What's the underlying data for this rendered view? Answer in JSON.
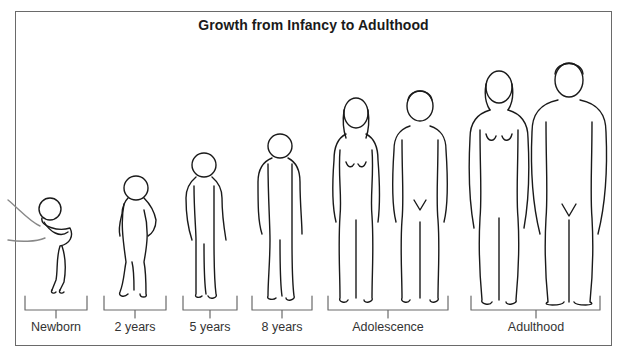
{
  "title": "Growth from Infancy to Adulthood",
  "stages": [
    {
      "label": "Newborn",
      "bracket": [
        25,
        87
      ],
      "figures": 1
    },
    {
      "label": "2 years",
      "bracket": [
        104,
        166
      ],
      "figures": 1
    },
    {
      "label": "5 years",
      "bracket": [
        183,
        237
      ],
      "figures": 1
    },
    {
      "label": "8 years",
      "bracket": [
        252,
        312
      ],
      "figures": 1
    },
    {
      "label": "Adolescence",
      "bracket": [
        328,
        448
      ],
      "figures": 2
    },
    {
      "label": "Adulthood",
      "bracket": [
        471,
        600
      ],
      "figures": 2
    }
  ],
  "colors": {
    "line": "#1a1a1a",
    "frame": "#6a6a6a",
    "text": "#333333"
  }
}
